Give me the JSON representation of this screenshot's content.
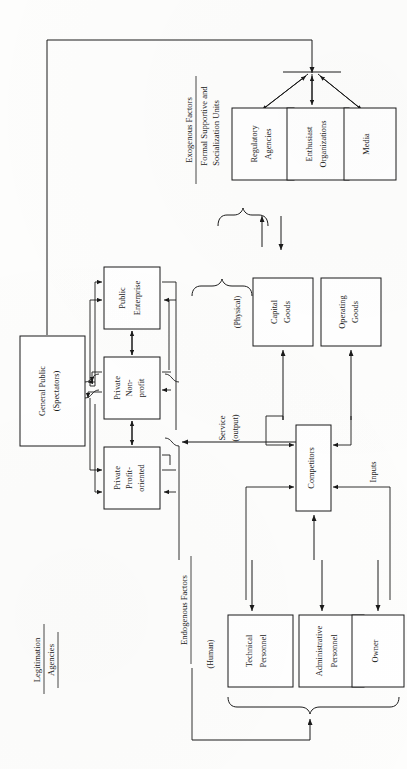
{
  "figure": {
    "orientation": "rotated-90-ccw"
  },
  "groups": {
    "exogenous": {
      "heading": "Exogenous Factors",
      "subheading_line1": "Formal Supportive and",
      "subheading_line2": "Socialization Units"
    },
    "endogenous": {
      "heading": "Endogenous Factors",
      "human_tag": "(Human)",
      "physical_tag": "(Physical)"
    },
    "legitimation": {
      "line1": "Legitimation",
      "line2": "Agencies"
    }
  },
  "boxes": {
    "regulatory_agencies": {
      "line1": "Regulatory",
      "line2": "Agencies"
    },
    "enthusiast_organizations": {
      "line1": "Enthusiast",
      "line2": "Organizations"
    },
    "media": {
      "line1": "Media",
      "line2": ""
    },
    "general_public": {
      "line1": "General Public",
      "line2": "(Spectators)"
    },
    "public_enterprise": {
      "line1": "Public",
      "line2": "Enterprise"
    },
    "private_nonprofit": {
      "line1": "Private",
      "line2": "Non-",
      "line3": "profit"
    },
    "private_profit": {
      "line1": "Private",
      "line2": "Profit-",
      "line3": "oriented"
    },
    "capital_goods": {
      "line1": "Capital",
      "line2": "Goods"
    },
    "operating_goods": {
      "line1": "Operating",
      "line2": "Goods"
    },
    "competitors": {
      "line1": "Competitors",
      "line2": ""
    },
    "technical_personnel": {
      "line1": "Technical",
      "line2": "Personnel"
    },
    "administrative_personnel": {
      "line1": "Administrative",
      "line2": "Personnel"
    },
    "owner": {
      "line1": "Owner",
      "line2": ""
    }
  },
  "flow_labels": {
    "service_line1": "Service",
    "service_line2": "(output)",
    "inputs": "Inputs"
  },
  "colors": {
    "ink": "#1a1a1a",
    "paper": "#fdfdfc",
    "box_fill": "#ffffff"
  }
}
